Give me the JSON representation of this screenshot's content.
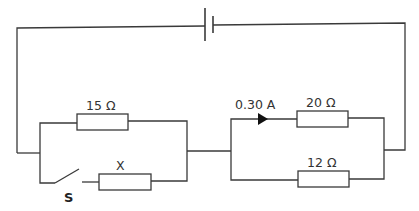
{
  "diagram": {
    "type": "circuit",
    "components": {
      "cell": {
        "name": "cell"
      },
      "resistor_15": {
        "label": "15 Ω"
      },
      "resistor_x": {
        "label": "X"
      },
      "switch": {
        "label": "S",
        "state": "open"
      },
      "resistor_20": {
        "label": "20 Ω"
      },
      "resistor_12": {
        "label": "12 Ω"
      },
      "current": {
        "label": "0.30 A",
        "direction": "right"
      }
    },
    "colors": {
      "line": "#3a3a3a",
      "background": "#ffffff"
    }
  }
}
